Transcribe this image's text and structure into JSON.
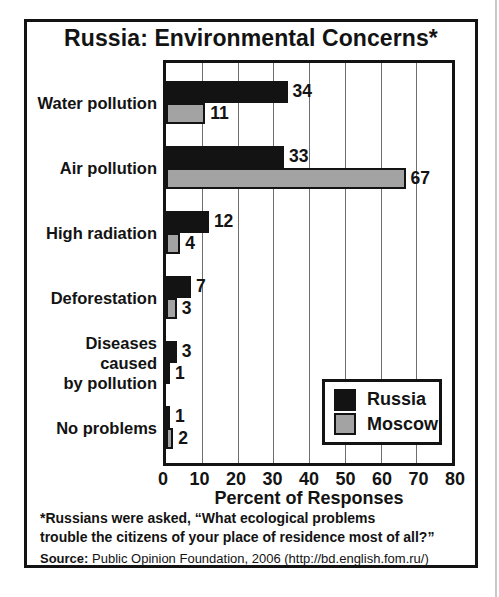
{
  "page": {
    "title": "Russia: Environmental Concerns*",
    "footnote": "*Russians were asked, “What ecological problems\ntrouble the citizens of your place of residence most of all?”",
    "source_label": "Source:",
    "source_text": " Public Opinion Foundation, 2006 (http://bd.english.fom.ru/)"
  },
  "chart_data": {
    "type": "bar",
    "orientation": "horizontal",
    "title": "Russia: Environmental Concerns*",
    "categories": [
      "Water pollution",
      "Air pollution",
      "High radiation",
      "Deforestation",
      "Diseases caused\nby pollution",
      "No problems"
    ],
    "series": [
      {
        "name": "Russia",
        "color": "#131313",
        "values": [
          34,
          33,
          12,
          7,
          3,
          1
        ]
      },
      {
        "name": "Moscow",
        "color": "#a3a3a3",
        "values": [
          11,
          67,
          4,
          3,
          1,
          2
        ]
      }
    ],
    "xlabel": "Percent of Responses",
    "xlim": [
      0,
      80
    ],
    "xticks": [
      0,
      10,
      20,
      30,
      40,
      50,
      60,
      70,
      80
    ],
    "grid": true,
    "gridline_color": "#6e6e6e",
    "legend_position": "lower right"
  }
}
